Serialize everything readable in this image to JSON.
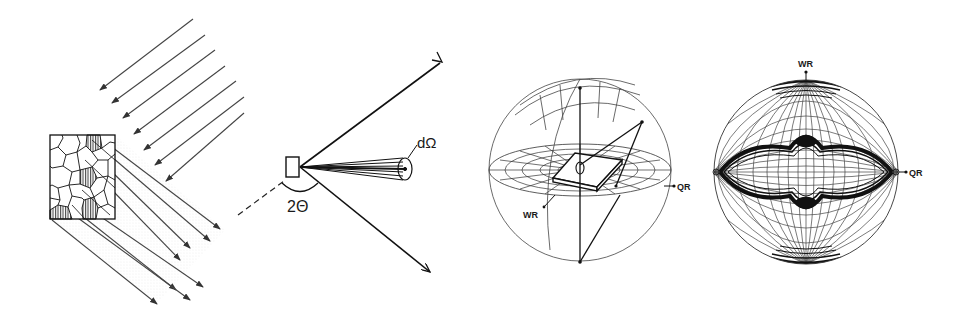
{
  "diagram": {
    "panels": [
      {
        "id": "polycrystal-panel",
        "description": "Polycrystalline sample irradiated by parallel incident beams; diffracted beams leave the grain aggregate"
      },
      {
        "id": "scattering-geometry-panel",
        "labels": {
          "solid_angle": "dΩ",
          "scattering_angle": "2Θ"
        }
      },
      {
        "id": "pole-sphere-panel",
        "labels": {
          "wr": "WR",
          "qr": "QR"
        }
      },
      {
        "id": "pole-figure-panel",
        "labels": {
          "wr": "WR",
          "qr": "QR"
        }
      }
    ],
    "colors": {
      "ink": "#1a1a1a",
      "grid": "#555555",
      "shade": "#d9d9d9",
      "background": "#ffffff"
    }
  }
}
